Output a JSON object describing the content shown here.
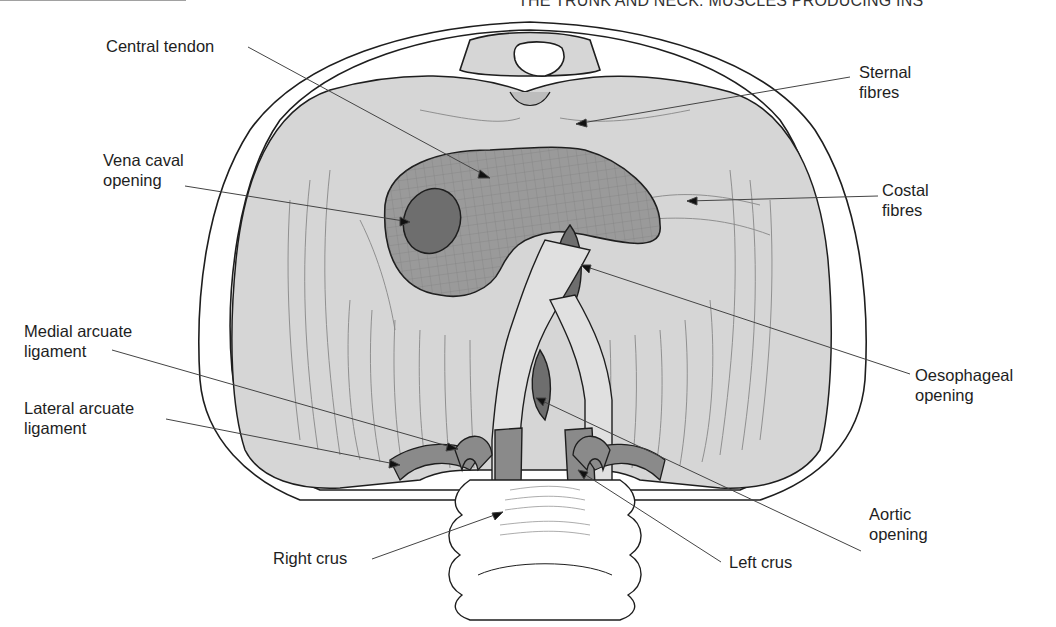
{
  "header": {
    "running_title": "THE TRUNK AND NECK: MUSCLES PRODUCING INS"
  },
  "figure": {
    "colors": {
      "muscle": "#d6d6d6",
      "tendon": "#9a9a9a",
      "opening": "#6e6e6e",
      "crus": "#8a8a8a",
      "outline": "#1e1e1e",
      "leader": "#444444",
      "bone": "#ffffff"
    }
  },
  "labels": {
    "central_tendon": "Central tendon",
    "vena_caval_opening": [
      "Vena caval",
      "opening"
    ],
    "medial_arcuate_ligament": [
      "Medial arcuate",
      "ligament"
    ],
    "lateral_arcuate_ligament": [
      "Lateral arcuate",
      "ligament"
    ],
    "right_crus": "Right crus",
    "sternal_fibres": [
      "Sternal",
      "fibres"
    ],
    "costal_fibres": [
      "Costal",
      "fibres"
    ],
    "oesophageal_opening": [
      "Oesophageal",
      "opening"
    ],
    "aortic_opening": [
      "Aortic",
      "opening"
    ],
    "left_crus": "Left crus"
  }
}
